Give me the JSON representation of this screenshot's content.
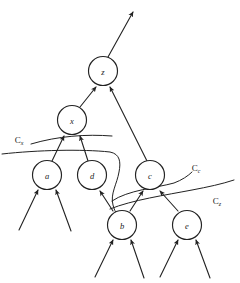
{
  "diagram": {
    "type": "directed-acyclic-graph",
    "background_color": "#ffffff",
    "stroke_color": "#222222",
    "nodes": [
      {
        "id": "z",
        "label": "z",
        "cx": 103,
        "cy": 71,
        "r": 14.5
      },
      {
        "id": "x",
        "label": "x",
        "cx": 72,
        "cy": 120,
        "r": 14.5
      },
      {
        "id": "a",
        "label": "a",
        "cx": 47,
        "cy": 175,
        "r": 14.5
      },
      {
        "id": "d",
        "label": "d",
        "cx": 92,
        "cy": 175,
        "r": 14.5
      },
      {
        "id": "c",
        "label": "c",
        "cx": 150,
        "cy": 175,
        "r": 14.5
      },
      {
        "id": "b",
        "label": "b",
        "cx": 122,
        "cy": 225,
        "r": 14.5
      },
      {
        "id": "e",
        "label": "e",
        "cx": 187,
        "cy": 225,
        "r": 14.5
      }
    ],
    "edges": [
      {
        "from": "z",
        "to": "out",
        "kind": "output"
      },
      {
        "from": "x",
        "to": "z",
        "kind": "internal"
      },
      {
        "from": "c",
        "to": "z",
        "kind": "internal"
      },
      {
        "from": "a",
        "to": "x",
        "kind": "internal"
      },
      {
        "from": "d",
        "to": "x",
        "kind": "internal"
      },
      {
        "from": "b",
        "to": "d",
        "kind": "internal"
      },
      {
        "from": "b",
        "to": "c",
        "kind": "internal"
      },
      {
        "from": "e",
        "to": "c",
        "kind": "internal"
      },
      {
        "from": "in1",
        "to": "a",
        "kind": "input"
      },
      {
        "from": "in2",
        "to": "a",
        "kind": "input"
      },
      {
        "from": "in3",
        "to": "b",
        "kind": "input"
      },
      {
        "from": "in4",
        "to": "b",
        "kind": "input"
      },
      {
        "from": "in5",
        "to": "e",
        "kind": "input"
      },
      {
        "from": "in6",
        "to": "e",
        "kind": "input"
      }
    ],
    "cuts": [
      {
        "id": "Cx",
        "base": "C",
        "subscript": "x",
        "label_x": 19,
        "label_y": 140
      },
      {
        "id": "Cc",
        "base": "C",
        "subscript": "c",
        "label_x": 196,
        "label_y": 168
      },
      {
        "id": "Cz",
        "base": "C",
        "subscript": "z",
        "label_x": 217,
        "label_y": 201
      }
    ]
  }
}
